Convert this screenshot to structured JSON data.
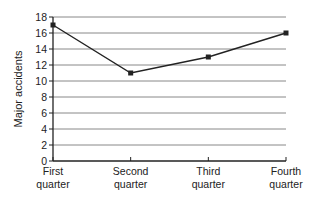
{
  "chart_data": {
    "type": "line",
    "title": "",
    "xlabel": "",
    "ylabel": "Major accidents",
    "categories": [
      [
        "First",
        "quarter"
      ],
      [
        "Second",
        "quarter"
      ],
      [
        "Third",
        "quarter"
      ],
      [
        "Fourth",
        "quarter"
      ]
    ],
    "category_labels": [
      "First quarter",
      "Second quarter",
      "Third quarter",
      "Fourth quarter"
    ],
    "series": [
      {
        "name": "Major accidents",
        "values": [
          17,
          11,
          13,
          16
        ]
      }
    ],
    "ylim": [
      0,
      18
    ],
    "yticks": [
      0,
      2,
      4,
      6,
      8,
      10,
      12,
      14,
      16,
      18
    ],
    "grid": true,
    "legend": "none",
    "colors": {
      "line": "#222222",
      "grid": "#888888",
      "axis": "#222222"
    }
  }
}
